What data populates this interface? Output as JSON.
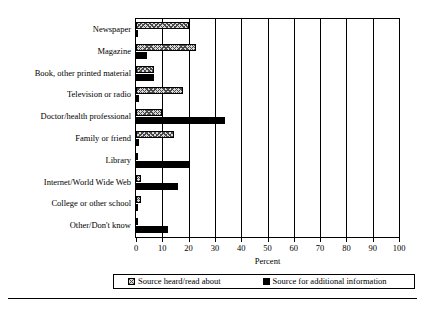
{
  "chart_data": {
    "type": "bar",
    "orientation": "horizontal",
    "title": "",
    "xlabel": "Percent",
    "ylabel": "",
    "xlim": [
      0,
      100
    ],
    "xticks": [
      0,
      10,
      20,
      30,
      40,
      50,
      60,
      70,
      80,
      90,
      100
    ],
    "grid": "vertical",
    "legend_position": "bottom",
    "categories": [
      "Newspaper",
      "Magazine",
      "Book, other printed material",
      "Television or radio",
      "Doctor/health professional",
      "Family or friend",
      "Library",
      "Internet/World Wide Web",
      "College or other school",
      "Other/Don't know"
    ],
    "series": [
      {
        "name": "Source heard/read about",
        "fill": "cross-hatch",
        "color": "#d9d9d9",
        "values": [
          20,
          23,
          7,
          18,
          10,
          14.5,
          0.3,
          2,
          2,
          0.3
        ]
      },
      {
        "name": "Source for additional information",
        "fill": "solid",
        "color": "#000000",
        "values": [
          0.7,
          4,
          7,
          1,
          34,
          1,
          20,
          16,
          0.5,
          12
        ]
      }
    ]
  },
  "axis": {
    "x_title": "Percent",
    "tick_labels": [
      "0",
      "10",
      "20",
      "30",
      "40",
      "50",
      "60",
      "70",
      "80",
      "90",
      "100"
    ]
  },
  "legend": {
    "entries": [
      {
        "label": "Source heard/read about",
        "swatch": "cross-hatch-swatch"
      },
      {
        "label": "Source for additional information",
        "swatch": "solid-black-swatch"
      }
    ]
  }
}
